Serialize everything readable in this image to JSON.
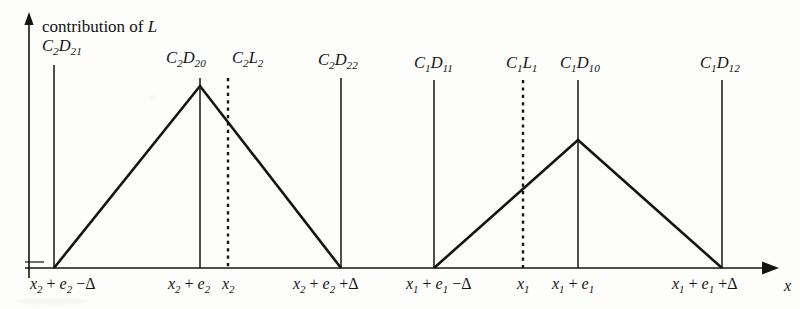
{
  "figure": {
    "axis_title": "contribution of",
    "axis_title_var": "L",
    "x_axis_label": "x",
    "background_color": "#fdfdfc",
    "line_color": "#141414"
  },
  "peak_labels": [
    {
      "name": "c2-d21",
      "text_main": "C",
      "sub1": "2",
      "text2": "D",
      "sub2": "21",
      "x": 42,
      "y": 38
    },
    {
      "name": "c2-d20",
      "text_main": "C",
      "sub1": "2",
      "text2": "D",
      "sub2": "20",
      "x": 166,
      "y": 50
    },
    {
      "name": "c2-l2",
      "text_main": "C",
      "sub1": "2",
      "text2": "L",
      "sub2": "2",
      "x": 232,
      "y": 50
    },
    {
      "name": "c2-d22",
      "text_main": "C",
      "sub1": "2",
      "text2": "D",
      "sub2": "22",
      "x": 318,
      "y": 52
    },
    {
      "name": "c1-d11",
      "text_main": "C",
      "sub1": "1",
      "text2": "D",
      "sub2": "11",
      "x": 414,
      "y": 55
    },
    {
      "name": "c1-l1",
      "text_main": "C",
      "sub1": "1",
      "text2": "L",
      "sub2": "1",
      "x": 506,
      "y": 55
    },
    {
      "name": "c1-d10",
      "text_main": "C",
      "sub1": "1",
      "text2": "D",
      "sub2": "10",
      "x": 560,
      "y": 55
    },
    {
      "name": "c1-d12",
      "text_main": "C",
      "sub1": "1",
      "text2": "D",
      "sub2": "12",
      "x": 700,
      "y": 55
    }
  ],
  "tick_labels": [
    {
      "name": "x2-plus-e2-minus-delta",
      "x": 30,
      "y": 276,
      "parts": [
        "x",
        "2",
        "+",
        "e",
        "2",
        "−Δ"
      ]
    },
    {
      "name": "x2-plus-e2",
      "x": 168,
      "y": 276,
      "parts": [
        "x",
        "2",
        "+",
        "e",
        "2",
        ""
      ]
    },
    {
      "name": "x2",
      "x": 222,
      "y": 276,
      "parts": [
        "x",
        "2",
        "",
        "",
        "",
        ""
      ]
    },
    {
      "name": "x2-plus-e2-plus-delta",
      "x": 293,
      "y": 276,
      "parts": [
        "x",
        "2",
        "+",
        "e",
        "2",
        "+Δ"
      ]
    },
    {
      "name": "x1-plus-e1-minus-delta",
      "x": 406,
      "y": 276,
      "parts": [
        "x",
        "1",
        "+",
        "e",
        "1",
        "−Δ"
      ]
    },
    {
      "name": "x1",
      "x": 517,
      "y": 276,
      "parts": [
        "x",
        "1",
        "",
        "",
        "",
        ""
      ]
    },
    {
      "name": "x1-plus-e1",
      "x": 552,
      "y": 276,
      "parts": [
        "x",
        "1",
        "+",
        "e",
        "1",
        ""
      ]
    },
    {
      "name": "x1-plus-e1-plus-delta",
      "x": 672,
      "y": 276,
      "parts": [
        "x",
        "1",
        "+",
        "e",
        "1",
        "+Δ"
      ]
    }
  ],
  "chart_data": {
    "type": "line",
    "title": "contribution of L",
    "xlabel": "x",
    "ylabel": "contribution of L",
    "grid": false,
    "legend": "none",
    "baseline_y_px": 268,
    "y_axis_x_px": 29,
    "y_axis_top_px": 14,
    "x_axis_end_px": 778,
    "annotations": [
      {
        "label": "C2D21",
        "x_px": 54,
        "line_top_px": 65,
        "type": "solid"
      },
      {
        "label": "C2D20",
        "x_px": 200,
        "line_top_px": 78,
        "type": "solid"
      },
      {
        "label": "C2L2",
        "x_px": 228,
        "line_top_px": 78,
        "type": "dotted"
      },
      {
        "label": "C2D22",
        "x_px": 341,
        "line_top_px": 78,
        "type": "solid"
      },
      {
        "label": "C1D11",
        "x_px": 434,
        "line_top_px": 80,
        "type": "solid"
      },
      {
        "label": "C1L1",
        "x_px": 523,
        "line_top_px": 80,
        "type": "dotted"
      },
      {
        "label": "C1D10",
        "x_px": 578,
        "line_top_px": 80,
        "type": "solid"
      },
      {
        "label": "C1D12",
        "x_px": 722,
        "line_top_px": 80,
        "type": "solid"
      }
    ],
    "series": [
      {
        "name": "triangle-2",
        "points_px": [
          [
            54,
            268
          ],
          [
            200,
            86
          ],
          [
            341,
            268
          ]
        ],
        "x_labels": [
          "x2+e2-Δ",
          "x2+e2",
          "x2+e2+Δ"
        ],
        "peak_x_label": "x2+e2",
        "peak_value_rel": 1.0
      },
      {
        "name": "triangle-1",
        "points_px": [
          [
            434,
            268
          ],
          [
            578,
            140
          ],
          [
            722,
            268
          ]
        ],
        "x_labels": [
          "x1+e1-Δ",
          "x1+e1",
          "x1+e1+Δ"
        ],
        "peak_x_label": "x1+e1",
        "peak_value_rel": 0.703
      }
    ]
  }
}
